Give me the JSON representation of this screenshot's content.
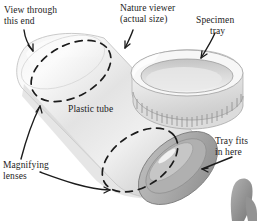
{
  "figure": {
    "medium": "grayscale product illustration",
    "background_color": "#ffffff",
    "ink_color": "#1c1c1c",
    "labels": [
      {
        "id": "view-through-this-end",
        "line1": "View through",
        "line2": "this end",
        "points_to": "upper-left tube opening / lens"
      },
      {
        "id": "nature-viewer",
        "line1": "Nature viewer",
        "line2": "(actual size)",
        "points_to": "plastic tube body"
      },
      {
        "id": "specimen-tray",
        "line1": "Specimen",
        "line2": "tray",
        "points_to": "detached knurled tray cap"
      },
      {
        "id": "plastic-tube",
        "line1": "Plastic tube",
        "line2": "",
        "points_to": "tube body (no arrow)"
      },
      {
        "id": "magnifying-lenses",
        "line1": "Magnifying",
        "line2": "lenses",
        "points_to": "two dashed ellipses marking lens positions"
      },
      {
        "id": "tray-fits-in-here",
        "line1": "Tray fits",
        "line2": "in here",
        "points_to": "lower-right tube opening"
      }
    ],
    "objects": [
      {
        "id": "plastic-tube",
        "description": "translucent cylinder lying diagonally from upper-left to lower-right"
      },
      {
        "id": "specimen-tray",
        "description": "shallow cap with ridged knurled rim, shown detached at upper right"
      },
      {
        "id": "lens-ellipse-upper",
        "description": "dashed ellipse near upper-left end of tube"
      },
      {
        "id": "lens-ellipse-lower",
        "description": "dashed ellipse near lower-right end of tube"
      },
      {
        "id": "tube-opening",
        "description": "elliptical open end at lower right of tube"
      }
    ]
  }
}
